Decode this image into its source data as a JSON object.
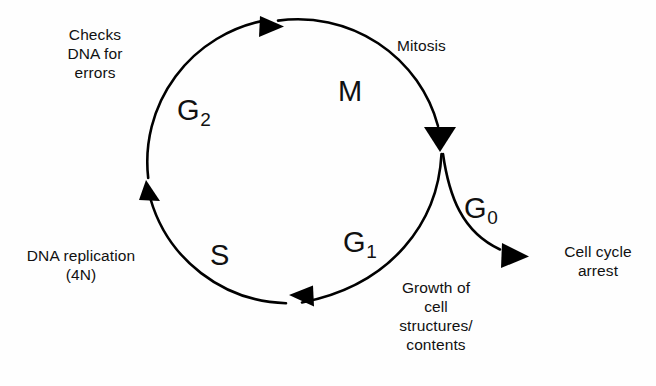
{
  "diagram": {
    "background_color": "#fefefe",
    "line_color": "#000000",
    "phases": {
      "m": {
        "letter": "M",
        "subscript": ""
      },
      "g2": {
        "letter": "G",
        "subscript": "2"
      },
      "s": {
        "letter": "S",
        "subscript": ""
      },
      "g1": {
        "letter": "G",
        "subscript": "1"
      },
      "g0": {
        "letter": "G",
        "subscript": "0"
      }
    },
    "annotations": {
      "mitosis": "Mitosis",
      "checks_dna": "Checks\nDNA for\nerrors",
      "dna_replication": "DNA replication\n(4N)",
      "growth": "Growth of\ncell\nstructures/\ncontents",
      "cell_cycle_arrest": "Cell cycle\narrest"
    }
  }
}
